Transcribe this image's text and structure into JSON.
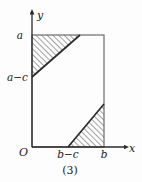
{
  "figure": {
    "caption": "(3)",
    "axes": {
      "x_axis_label": "x",
      "y_axis_label": "y",
      "origin_label": "O"
    },
    "y_ticks": [
      {
        "label": "a",
        "value_px_y": 35
      },
      {
        "label": "a−c",
        "value_px_y": 77
      }
    ],
    "x_ticks": [
      {
        "label": "b−c",
        "value_px_x": 68
      },
      {
        "label": "b",
        "value_px_x": 104
      }
    ],
    "rectangle": {
      "left_px": 32,
      "right_px": 104,
      "top_px": 35,
      "bottom_px": 147,
      "stroke": "#6b6b6b"
    },
    "shaded_regions": [
      {
        "name": "upper-left-triangle",
        "hatch": "diagonal-45",
        "points": "32,35 80,35 32,77"
      },
      {
        "name": "lower-right-triangle",
        "hatch": "diagonal-45",
        "points": "68,147 104,147 104,104"
      }
    ],
    "colors": {
      "line": "#6b6b6b",
      "hatch": "#555555",
      "boundary": "#2b2b2b",
      "text": "#1a1a1a",
      "background": "#fdfdfd"
    }
  }
}
